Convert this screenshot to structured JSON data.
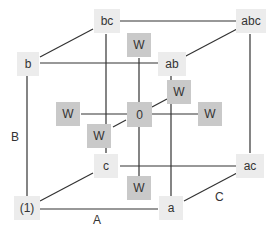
{
  "diagram": {
    "type": "factorial-cube-design",
    "corners": {
      "one": "(1)",
      "a": "a",
      "b": "b",
      "ab": "ab",
      "c": "c",
      "ac": "ac",
      "bc": "bc",
      "abc": "abc"
    },
    "center": "0",
    "star_points": [
      "W",
      "W",
      "W",
      "W",
      "W",
      "W"
    ],
    "axes": {
      "A": "A",
      "B": "B",
      "C": "C"
    },
    "colors": {
      "corner_fill": "#ececec",
      "star_fill": "#c9c9c9",
      "line": "#333333"
    }
  }
}
